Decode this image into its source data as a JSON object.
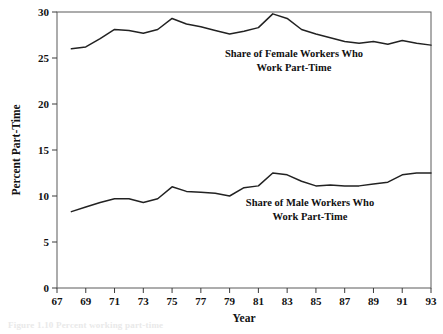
{
  "chart_data": {
    "type": "line",
    "title": "",
    "xlabel": "Year",
    "ylabel": "Percent Part-Time",
    "xlim": [
      67,
      93
    ],
    "ylim": [
      0,
      30
    ],
    "grid": false,
    "legend_position": "inline-annotation",
    "x_tick_labels": [
      "67",
      "69",
      "71",
      "73",
      "75",
      "77",
      "79",
      "81",
      "83",
      "85",
      "87",
      "89",
      "91",
      "93"
    ],
    "x_ticks": [
      67,
      69,
      71,
      73,
      75,
      77,
      79,
      81,
      83,
      85,
      87,
      89,
      91,
      93
    ],
    "y_tick_labels": [
      "0",
      "5",
      "10",
      "15",
      "20",
      "25",
      "30"
    ],
    "y_ticks": [
      0,
      5,
      10,
      15,
      20,
      25,
      30
    ],
    "x": [
      68,
      69,
      70,
      71,
      72,
      73,
      74,
      75,
      76,
      77,
      78,
      79,
      80,
      81,
      82,
      83,
      84,
      85,
      86,
      87,
      88,
      89,
      90,
      91,
      92,
      93
    ],
    "series": [
      {
        "name": "Share of Female Workers Who Work Part-Time",
        "color": "#222222",
        "values": [
          26.0,
          26.2,
          27.1,
          28.1,
          28.0,
          27.7,
          28.1,
          29.3,
          28.7,
          28.4,
          28.0,
          27.6,
          27.9,
          28.3,
          29.8,
          29.3,
          28.1,
          27.6,
          27.2,
          26.8,
          26.6,
          26.8,
          26.5,
          26.9,
          26.6,
          26.4
        ]
      },
      {
        "name": "Share of Male Workers Who Work Part-Time",
        "color": "#222222",
        "values": [
          8.3,
          8.8,
          9.3,
          9.7,
          9.7,
          9.3,
          9.7,
          11.0,
          10.5,
          10.4,
          10.3,
          10.0,
          10.9,
          11.1,
          12.5,
          12.3,
          11.6,
          11.1,
          11.2,
          11.1,
          11.1,
          11.3,
          11.5,
          12.3,
          12.5,
          12.5
        ]
      }
    ],
    "annotations": [
      {
        "id": "female-annotation",
        "lines": [
          "Share of Female Workers Who",
          "Work Part-Time"
        ],
        "x_px": 294,
        "y_px": 57
      },
      {
        "id": "male-annotation",
        "lines": [
          "Share of Male Workers Who",
          "Work Part-Time"
        ],
        "x_px": 310,
        "y_px": 206
      }
    ]
  },
  "caption": {
    "fragment": "Figure 1.10  Percent working part-time"
  }
}
